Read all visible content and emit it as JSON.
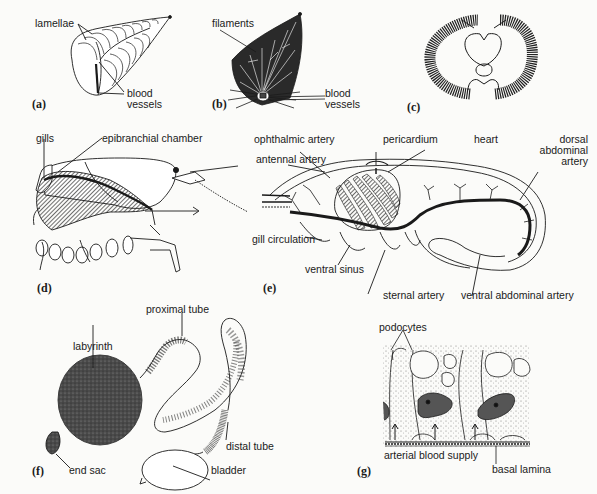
{
  "panels": {
    "a": {
      "tag": "(a)",
      "labels": {
        "lamellae": "lamellae",
        "blood_vessels_1": "blood",
        "blood_vessels_2": "vessels"
      }
    },
    "b": {
      "tag": "(b)",
      "labels": {
        "filaments": "filaments",
        "blood_vessels_1": "blood",
        "blood_vessels_2": "vessels"
      }
    },
    "c": {
      "tag": "(c)",
      "labels": {}
    },
    "d": {
      "tag": "(d)",
      "labels": {
        "gills": "gills",
        "epibranchial_chamber": "epibranchial chamber"
      }
    },
    "e": {
      "tag": "(e)",
      "labels": {
        "ophthalmic_artery": "ophthalmic artery",
        "pericardium": "pericardium",
        "heart": "heart",
        "dorsal_1": "dorsal",
        "dorsal_2": "abdominal",
        "dorsal_3": "artery",
        "antennal_artery": "antennal artery",
        "gill_circulation": "gill circulation",
        "ventral_sinus": "ventral sinus",
        "sternal_artery": "sternal artery",
        "ventral_abdominal_artery": "ventral abdominal artery"
      }
    },
    "f": {
      "tag": "(f)",
      "labels": {
        "proximal_tube": "proximal tube",
        "labyrinth": "labyrinth",
        "distal_tube": "distal tube",
        "end_sac": "end sac",
        "bladder": "bladder"
      }
    },
    "g": {
      "tag": "(g)",
      "labels": {
        "podocytes": "podocytes",
        "arterial_blood_supply": "arterial blood supply",
        "basal_lamina": "basal lamina"
      }
    }
  },
  "colors": {
    "ink": "#1a1a1a",
    "background": "#fbfbf9",
    "shade": "#555555"
  }
}
